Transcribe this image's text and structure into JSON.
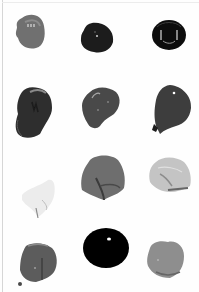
{
  "image": {
    "description": "Twelve paint blob swatches arranged in a 3-column by 4-row grid on a white background",
    "background_color": "#ffffff",
    "border_color": "#d6d6d6"
  },
  "swatches": [
    {
      "row": 1,
      "col": 1,
      "shade": "#6f6f6f",
      "highlight": "#b0b0b0",
      "shape": "rounded-blob"
    },
    {
      "row": 1,
      "col": 2,
      "shade": "#1c1c1c",
      "highlight": "#cfcfcf",
      "shape": "rounded-blob"
    },
    {
      "row": 1,
      "col": 3,
      "shade": "#0e0e0e",
      "highlight": "#d8d8d8",
      "shape": "round-ring"
    },
    {
      "row": 2,
      "col": 1,
      "shade": "#2e2e2e",
      "highlight": "#8a8a8a",
      "shape": "irregular-blob"
    },
    {
      "row": 2,
      "col": 2,
      "shade": "#4a4a4a",
      "highlight": "#a8a8a8",
      "shape": "irregular-blob"
    },
    {
      "row": 2,
      "col": 3,
      "shade": "#3c3c3c",
      "highlight": "#ffffff",
      "shape": "teardrop"
    },
    {
      "row": 3,
      "col": 1,
      "shade": "#ececec",
      "highlight": "#8a8a8a",
      "shape": "smear"
    },
    {
      "row": 3,
      "col": 2,
      "shade": "#6e6e6e",
      "highlight": "#3a3a3a",
      "shape": "dome"
    },
    {
      "row": 3,
      "col": 3,
      "shade": "#c4c4c4",
      "highlight": "#8c8c8c",
      "shape": "smear"
    },
    {
      "row": 4,
      "col": 1,
      "shade": "#5c5c5c",
      "highlight": "#2c2c2c",
      "shape": "round-blob"
    },
    {
      "row": 4,
      "col": 2,
      "shade": "#050505",
      "highlight": "#ffffff",
      "shape": "oval"
    },
    {
      "row": 4,
      "col": 3,
      "shade": "#8e8e8e",
      "highlight": "#666666",
      "shape": "heart-blob"
    }
  ]
}
